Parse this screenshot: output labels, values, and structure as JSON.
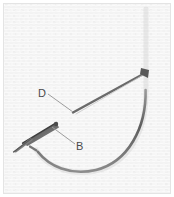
{
  "figure": {
    "caption_title": "Fish hook diagram",
    "width": 174,
    "height": 197,
    "background_color": "#fdfdfd",
    "border_color": "#e2e2e2",
    "texture_color": "#f0f0f0",
    "hook_color": "#6b6b6b",
    "hook_dark_color": "#4d4d4d",
    "leader_color": "#8a8a8a",
    "label_color": "#4a4a4a"
  },
  "labels": [
    {
      "id": "label-d",
      "text": "D",
      "x": 38,
      "y": 97,
      "leader_from_x": 48,
      "leader_from_y": 94,
      "leader_to_x": 73,
      "leader_to_y": 112
    },
    {
      "id": "label-b",
      "text": "B",
      "x": 76,
      "y": 150,
      "leader_from_x": 75,
      "leader_from_y": 144,
      "leader_to_x": 52,
      "leader_to_y": 127
    }
  ],
  "parts": {
    "shank_label": "shank",
    "bend_label": "bend",
    "point_label": "point",
    "barb_label": "barb",
    "eye_label": "eye"
  }
}
